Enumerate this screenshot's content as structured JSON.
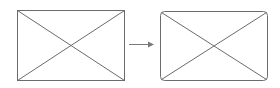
{
  "diagram": {
    "colors": {
      "stroke": "#6b6b6b",
      "arrow": "#7a7a7a",
      "background": "#ffffff"
    },
    "shapes": [
      {
        "id": "left",
        "label": "",
        "corner_style": "square"
      },
      {
        "id": "right",
        "label": "",
        "corner_style": "rounded"
      }
    ],
    "arrow": {
      "direction": "right",
      "label": ""
    }
  }
}
